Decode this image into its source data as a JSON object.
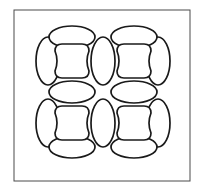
{
  "figure": {
    "background_color": "#ffffff",
    "stroke_color": "#1a1a1a",
    "fill_color": "#ffffff",
    "canvas": {
      "width": 202,
      "height": 192
    }
  },
  "frame": {
    "name": "outer-border",
    "x": 14,
    "y": 10,
    "width": 176,
    "height": 171,
    "stroke_width": 1,
    "stroke_color": "#4a4a4a"
  },
  "lattice": {
    "rows": 2,
    "columns": 2,
    "cell_pitch_x": 62,
    "cell_pitch_y": 62,
    "origin_x": 72,
    "origin_y": 61,
    "core_stroke_width": 1.7,
    "ellipse_stroke_width": 1.7,
    "core": {
      "name": "rounded-square-core",
      "half_width": 17,
      "half_height": 17,
      "concavity": 4
    },
    "ellipse_horizontal": {
      "name": "horizontal-ellipse",
      "rx": 23,
      "ry": 11
    },
    "ellipse_vertical": {
      "name": "vertical-ellipse",
      "rx": 12,
      "ry": 24
    },
    "cells": [
      {
        "id": "cell-top-left",
        "row": 0,
        "col": 0,
        "cx": 72,
        "cy": 61
      },
      {
        "id": "cell-top-right",
        "row": 0,
        "col": 1,
        "cx": 134,
        "cy": 61
      },
      {
        "id": "cell-bottom-left",
        "row": 1,
        "col": 0,
        "cx": 72,
        "cy": 123
      },
      {
        "id": "cell-bottom-right",
        "row": 1,
        "col": 1,
        "cx": 134,
        "cy": 123
      }
    ],
    "nodes_horizontal": [
      {
        "id": "h-ellipse-r0-top",
        "cx": 72,
        "cy": 37
      },
      {
        "id": "h-ellipse-r0-bottom",
        "cx": 134,
        "cy": 37
      },
      {
        "id": "h-ellipse-r1-top",
        "cx": 72,
        "cy": 92
      },
      {
        "id": "h-ellipse-r1-mid",
        "cx": 134,
        "cy": 92
      },
      {
        "id": "h-ellipse-r2-left",
        "cx": 72,
        "cy": 147
      },
      {
        "id": "h-ellipse-r2-right",
        "cx": 134,
        "cy": 147
      }
    ],
    "nodes_vertical": [
      {
        "id": "v-ellipse-c0-r0",
        "cx": 48,
        "cy": 61
      },
      {
        "id": "v-ellipse-c1-r0",
        "cx": 103,
        "cy": 61
      },
      {
        "id": "v-ellipse-c2-r0",
        "cx": 158,
        "cy": 61
      },
      {
        "id": "v-ellipse-c0-r1",
        "cx": 48,
        "cy": 123
      },
      {
        "id": "v-ellipse-c1-r1",
        "cx": 103,
        "cy": 123
      },
      {
        "id": "v-ellipse-c2-r1",
        "cx": 158,
        "cy": 123
      }
    ]
  },
  "labels": {
    "caption": ""
  }
}
